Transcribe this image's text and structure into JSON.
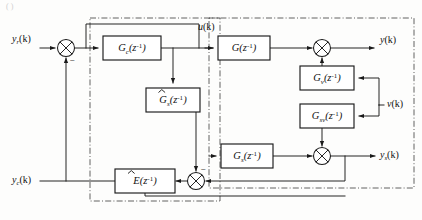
{
  "figure": {
    "type": "control-block-diagram",
    "background_color": "#fdfdfc",
    "line_color": "#1a1a1a",
    "dashed_group_color": "#3a3a3a"
  },
  "blocks": [
    {
      "id": "gc",
      "name": "controller-block",
      "label_main": "G",
      "label_sub": "c",
      "label_arg": "(z",
      "label_sup": "-1",
      "label_close": ")",
      "hat": false,
      "x": 103,
      "y": 36,
      "w": 58,
      "h": 24
    },
    {
      "id": "g",
      "name": "process-block",
      "label_main": "G",
      "label_sub": "",
      "label_arg": "(z",
      "label_sup": "-1",
      "label_close": ")",
      "hat": false,
      "x": 218,
      "y": 36,
      "w": 52,
      "h": 24
    },
    {
      "id": "gs_hat",
      "name": "soft-sensor-model-block",
      "label_main": "G",
      "label_sub": "s",
      "label_arg": "(z",
      "label_sup": "-1",
      "label_close": ")",
      "hat": true,
      "x": 146,
      "y": 88,
      "w": 54,
      "h": 24
    },
    {
      "id": "gv",
      "name": "noise-filter-block",
      "label_main": "G",
      "label_sub": "v",
      "label_arg": "(z",
      "label_sup": "-1",
      "label_close": ")",
      "hat": false,
      "x": 300,
      "y": 66,
      "w": 54,
      "h": 24
    },
    {
      "id": "gsv",
      "name": "sensor-noise-filter-block",
      "label_main": "G",
      "label_sub": "sv",
      "label_arg": "(z",
      "label_sup": "-1",
      "label_close": ")",
      "hat": false,
      "x": 300,
      "y": 104,
      "w": 54,
      "h": 24
    },
    {
      "id": "gs",
      "name": "sensor-block",
      "label_main": "G",
      "label_sub": "s",
      "label_arg": "(z",
      "label_sup": "-1",
      "label_close": ")",
      "hat": false,
      "x": 221,
      "y": 144,
      "w": 52,
      "h": 24
    },
    {
      "id": "e_hat",
      "name": "estimator-block",
      "label_main": "E",
      "label_sub": "",
      "label_arg": "(z",
      "label_sup": "-1",
      "label_close": ")",
      "hat": true,
      "x": 115,
      "y": 169,
      "w": 60,
      "h": 24
    }
  ],
  "summing_junctions": [
    {
      "id": "sum_in",
      "name": "input-summing-junction",
      "cx": 66,
      "cy": 48,
      "r": 8.5,
      "signs": [
        {
          "text": "-",
          "x": 70,
          "y": 61
        }
      ]
    },
    {
      "id": "sum_out",
      "name": "output-summing-junction",
      "cx": 322,
      "cy": 48,
      "r": 8.5,
      "signs": []
    },
    {
      "id": "sum_sen",
      "name": "sensor-summing-junction",
      "cx": 322,
      "cy": 156,
      "r": 8.5,
      "signs": []
    },
    {
      "id": "sum_err",
      "name": "estimator-error-junction",
      "cx": 196,
      "cy": 181,
      "r": 8.5,
      "signs": [
        {
          "text": "-",
          "x": 201,
          "y": 169
        }
      ]
    }
  ],
  "signals": [
    {
      "id": "yr",
      "name": "reference-input-label",
      "base": "y",
      "sub": "r",
      "arg": "(k)",
      "x": 12,
      "y": 40
    },
    {
      "id": "u",
      "name": "control-signal-label",
      "base": "u",
      "sub": "",
      "arg": "(k)",
      "x": 200,
      "y": 28
    },
    {
      "id": "y",
      "name": "process-output-label",
      "base": "y",
      "sub": "",
      "arg": "(k)",
      "x": 382,
      "y": 41
    },
    {
      "id": "v",
      "name": "disturbance-input-label",
      "base": "v",
      "sub": "",
      "arg": "(k)",
      "x": 388,
      "y": 105
    },
    {
      "id": "ys",
      "name": "sensor-output-label",
      "base": "y",
      "sub": "s",
      "arg": "(k)",
      "x": 383,
      "y": 156
    },
    {
      "id": "yc",
      "name": "estimated-output-label",
      "base": "y",
      "sub": "c",
      "arg": "(k)",
      "x": 12,
      "y": 181
    }
  ],
  "dashed_groups": [
    {
      "id": "left-group",
      "name": "controller-estimator-group",
      "x": 90,
      "y": 18,
      "w": 130,
      "h": 183
    },
    {
      "id": "right-group",
      "name": "plant-sensor-group",
      "x": 209,
      "y": 18,
      "w": 205,
      "h": 170
    }
  ],
  "top_artifact": "(                )"
}
